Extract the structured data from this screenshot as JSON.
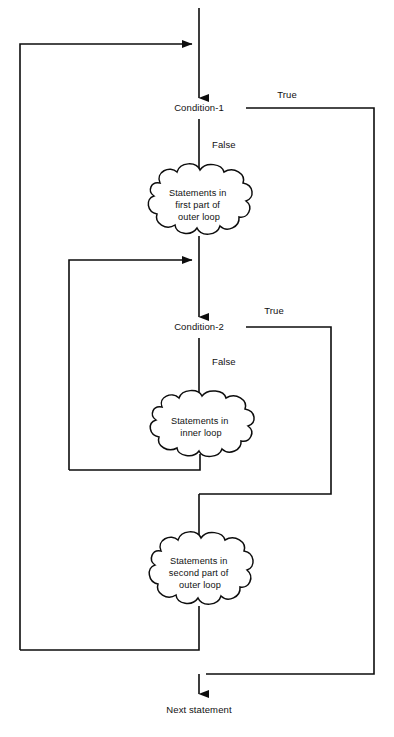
{
  "diagram": {
    "type": "flowchart",
    "canvas": {
      "width": 394,
      "height": 737
    },
    "stroke_color": "#0d0d0d",
    "background_color": "#ffffff"
  },
  "nodes": {
    "condition1": {
      "label": "Condition-1",
      "x": 199,
      "y": 111
    },
    "condition2": {
      "label": "Condition-2",
      "x": 199,
      "y": 330
    },
    "process1": {
      "lines": [
        "Statements in",
        "first part of",
        "outer loop"
      ],
      "cx": 199,
      "cy": 205
    },
    "process2": {
      "lines": [
        "Statements in",
        "inner loop"
      ],
      "cx": 201,
      "cy": 426
    },
    "process3": {
      "lines": [
        "Statements in",
        "second part of",
        "outer loop"
      ],
      "cx": 200,
      "cy": 573
    },
    "terminal": {
      "label": "Next statement",
      "x": 199,
      "y": 710
    }
  },
  "edge_labels": {
    "cond1_true": {
      "text": "True",
      "x": 287,
      "y": 98
    },
    "cond1_false": {
      "text": "False",
      "x": 212,
      "y": 145
    },
    "cond2_true": {
      "text": "True",
      "x": 274,
      "y": 314
    },
    "cond2_false": {
      "text": "False",
      "x": 212,
      "y": 361
    }
  },
  "geometry": {
    "main_x": 199,
    "outer_left_x": 20,
    "inner_left_x": 69,
    "cond1_true_right_x": 374,
    "cond2_true_right_x": 331,
    "top_y": 8,
    "outer_back_entry_y": 44,
    "cond1_y": 108,
    "inner_back_entry_y": 260,
    "cond2_y": 327,
    "inner_back_bottom_y": 470,
    "cond2_merge_y": 494,
    "outer_back_bottom_y": 650,
    "final_merge_y": 674,
    "terminal_arrow_y": 694
  }
}
